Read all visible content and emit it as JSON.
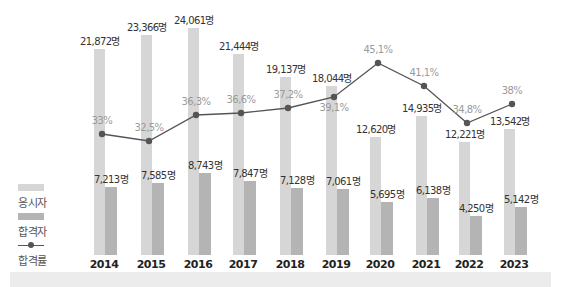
{
  "legend": {
    "applicants_label": "응시자",
    "passers_label": "합격자",
    "rate_label": "합격률"
  },
  "colors": {
    "applicants": "#d6d6d6",
    "passers": "#b4b4b4",
    "line": "#555555",
    "rate_text": "#9a9a9a",
    "value_text": "#333333",
    "year_text": "#222222"
  },
  "chart_data": {
    "type": "bar",
    "title": "",
    "xlabel": "",
    "ylabel": "",
    "categories": [
      "2014",
      "2015",
      "2016",
      "2017",
      "2018",
      "2019",
      "2020",
      "2021",
      "2022",
      "2023"
    ],
    "series": [
      {
        "name": "응시자",
        "type": "bar",
        "values": [
          21872,
          23366,
          24061,
          21444,
          19137,
          18044,
          12620,
          14935,
          12221,
          13542
        ],
        "labels": [
          "21,872명",
          "23,366명",
          "24,061명",
          "21,444명",
          "19,137명",
          "18,044명",
          "12,620명",
          "14,935명",
          "12,221명",
          "13,542명"
        ]
      },
      {
        "name": "합격자",
        "type": "bar",
        "values": [
          7213,
          7585,
          8743,
          7847,
          7128,
          7061,
          5695,
          6138,
          4250,
          5142
        ],
        "labels": [
          "7,213명",
          "7,585명",
          "8,743명",
          "7,847명",
          "7,128명",
          "7,061명",
          "5,695명",
          "6,138명",
          "4,250명",
          "5,142명"
        ]
      },
      {
        "name": "합격률",
        "type": "line",
        "values": [
          33,
          32.5,
          36.3,
          36.6,
          37.2,
          39.1,
          45.1,
          41.1,
          34.8,
          38
        ],
        "labels": [
          "33%",
          "32,5%",
          "36,3%",
          "36,6%",
          "37,2%",
          "39,1%",
          "45,1%",
          "41,1%",
          "34,8%",
          "38%"
        ]
      }
    ],
    "legend_position": "left",
    "grid": false
  },
  "layout": {
    "centers": [
      101,
      148,
      195,
      240,
      287,
      333,
      377,
      423,
      466,
      511
    ],
    "applicant_tops": [
      49,
      35,
      28,
      54,
      77,
      86,
      137,
      116,
      142,
      129
    ],
    "passer_tops": [
      187,
      183,
      173,
      181,
      188,
      189,
      202,
      198,
      216,
      207
    ],
    "rate_y": [
      134,
      141,
      115,
      113,
      108,
      97,
      63,
      86,
      123,
      104
    ],
    "rate_label_dy": [
      -12,
      -12,
      -12,
      -12,
      -12,
      14,
      -12,
      -12,
      -12,
      -12
    ],
    "baseline": 255,
    "year_y": 268
  }
}
